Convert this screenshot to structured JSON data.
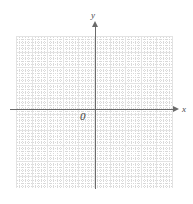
{
  "figure": {
    "kind": "cartesian-coordinate-grid",
    "background_color": "#ffffff"
  },
  "axes": {
    "x_label": "x",
    "y_label": "y",
    "origin_label": "0",
    "axis_color": "#6b6b6b",
    "x_arrow_direction": "right",
    "y_arrow_direction": "up"
  },
  "grid": {
    "major_color": "#e3e3e3",
    "minor_color": "#d9d9d9",
    "major_spacing_px": 15.6,
    "minor_spacing_px": 3.12,
    "minor_per_major": 5,
    "left_px": 16,
    "top_px": 36,
    "width_px": 156,
    "height_px": 152
  },
  "chart_data": {
    "type": "scatter",
    "title": "",
    "xlabel": "x",
    "ylabel": "y",
    "series": [
      {
        "name": "",
        "x": [],
        "y": []
      }
    ],
    "xlim": [
      -5,
      5
    ],
    "ylim": [
      -5,
      5
    ],
    "xticks": [],
    "yticks": [],
    "grid": true,
    "legend": "none",
    "annotations": [
      "0"
    ]
  }
}
